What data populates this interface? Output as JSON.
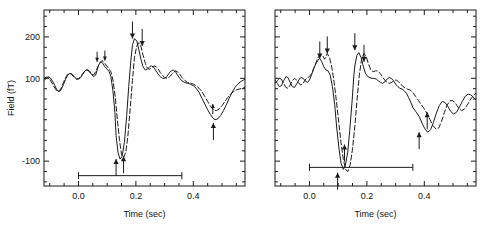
{
  "figure": {
    "type": "biomagnetic-field-waveform-figure",
    "panel_count": 2,
    "caption_partial": ""
  },
  "axes": {
    "xlabel": "Time (sec)",
    "ylabel": "Field (fT)",
    "xticks_labeled": [
      "0.0",
      "0.2",
      "0.4"
    ],
    "xtick_values": [
      0.0,
      0.2,
      0.4
    ],
    "yticks_labeled": [
      "200",
      "100",
      "-100"
    ],
    "ytick_values": [
      200,
      100,
      -100
    ],
    "xlim": [
      -0.12,
      0.58
    ],
    "ylim": [
      -160,
      265
    ],
    "grid": "off",
    "minor_ticks": "on"
  },
  "chart_data": {
    "type": "line",
    "title": "",
    "xlabel": "Time (sec)",
    "ylabel": "Field (fT)",
    "xlim": [
      -0.12,
      0.58
    ],
    "ylim": [
      -160,
      265
    ],
    "grid": false,
    "legend": "none",
    "panels": [
      {
        "name": "left-panel",
        "id": "panel-a",
        "y_axis_labeled": true,
        "stimulus_bar": {
          "start": 0.0,
          "end": 0.36,
          "y_value": -135
        },
        "annotations": [
          {
            "marker": "down-arrow",
            "x": 0.065,
            "y": 140,
            "size": "small"
          },
          {
            "marker": "down-arrow",
            "x": 0.092,
            "y": 143,
            "size": "small"
          },
          {
            "marker": "down-arrow",
            "x": 0.188,
            "y": 196,
            "size": "large"
          },
          {
            "marker": "down-arrow",
            "x": 0.222,
            "y": 178,
            "size": "large"
          },
          {
            "marker": "up-arrow",
            "x": 0.131,
            "y": -95,
            "size": "large"
          },
          {
            "marker": "up-arrow",
            "x": 0.157,
            "y": -88,
            "size": "large"
          },
          {
            "marker": "up-arrow",
            "x": 0.468,
            "y": 38,
            "size": "small"
          },
          {
            "marker": "up-arrow",
            "x": 0.47,
            "y": -8,
            "size": "large"
          }
        ],
        "series": [
          {
            "name": "trace-solid",
            "style": "solid",
            "x": [
              -0.12,
              -0.112,
              -0.105,
              -0.098,
              -0.09,
              -0.082,
              -0.075,
              -0.067,
              -0.06,
              -0.052,
              -0.045,
              -0.037,
              -0.03,
              -0.022,
              -0.015,
              -0.007,
              0.0,
              0.008,
              0.015,
              0.023,
              0.03,
              0.038,
              0.045,
              0.053,
              0.06,
              0.065,
              0.07,
              0.078,
              0.085,
              0.092,
              0.1,
              0.107,
              0.113,
              0.12,
              0.127,
              0.131,
              0.138,
              0.145,
              0.152,
              0.16,
              0.168,
              0.175,
              0.182,
              0.188,
              0.195,
              0.203,
              0.21,
              0.218,
              0.225,
              0.233,
              0.24,
              0.248,
              0.255,
              0.263,
              0.27,
              0.278,
              0.285,
              0.293,
              0.3,
              0.308,
              0.315,
              0.323,
              0.33,
              0.338,
              0.345,
              0.353,
              0.36,
              0.37,
              0.38,
              0.39,
              0.4,
              0.41,
              0.42,
              0.43,
              0.44,
              0.45,
              0.46,
              0.468,
              0.475,
              0.485,
              0.495,
              0.505,
              0.515,
              0.525,
              0.535,
              0.545,
              0.555,
              0.565,
              0.575,
              0.58
            ],
            "y": [
              95,
              100,
              104,
              101,
              93,
              82,
              72,
              68,
              73,
              85,
              98,
              108,
              112,
              110,
              104,
              99,
              98,
              102,
              110,
              118,
              121,
              118,
              110,
              104,
              108,
              120,
              132,
              140,
              136,
              128,
              122,
              116,
              104,
              70,
              18,
              -38,
              -80,
              -95,
              -88,
              -55,
              10,
              80,
              140,
              180,
              196,
              190,
              170,
              145,
              128,
              120,
              122,
              128,
              130,
              126,
              118,
              110,
              104,
              100,
              100,
              104,
              112,
              118,
              120,
              116,
              108,
              100,
              94,
              90,
              88,
              86,
              82,
              76,
              66,
              52,
              38,
              24,
              12,
              4,
              0,
              2,
              10,
              22,
              36,
              52,
              66,
              78,
              86,
              92,
              96,
              98,
              98
            ]
          },
          {
            "name": "trace-dashed",
            "style": "dashed",
            "x": [
              -0.12,
              -0.112,
              -0.105,
              -0.098,
              -0.09,
              -0.082,
              -0.075,
              -0.067,
              -0.06,
              -0.052,
              -0.045,
              -0.037,
              -0.03,
              -0.022,
              -0.015,
              -0.007,
              0.0,
              0.008,
              0.015,
              0.023,
              0.03,
              0.038,
              0.045,
              0.053,
              0.06,
              0.068,
              0.075,
              0.082,
              0.09,
              0.098,
              0.105,
              0.113,
              0.12,
              0.128,
              0.135,
              0.143,
              0.15,
              0.157,
              0.165,
              0.172,
              0.18,
              0.188,
              0.195,
              0.203,
              0.21,
              0.218,
              0.225,
              0.233,
              0.24,
              0.248,
              0.255,
              0.263,
              0.27,
              0.278,
              0.285,
              0.293,
              0.3,
              0.308,
              0.315,
              0.323,
              0.33,
              0.338,
              0.345,
              0.353,
              0.36,
              0.37,
              0.38,
              0.39,
              0.4,
              0.41,
              0.42,
              0.43,
              0.44,
              0.45,
              0.46,
              0.47,
              0.48,
              0.49,
              0.5,
              0.51,
              0.52,
              0.53,
              0.54,
              0.55,
              0.56,
              0.57,
              0.58
            ],
            "y": [
              100,
              103,
              102,
              96,
              86,
              76,
              69,
              69,
              77,
              90,
              102,
              110,
              112,
              108,
              102,
              98,
              99,
              104,
              112,
              118,
              120,
              116,
              110,
              108,
              116,
              128,
              138,
              143,
              138,
              130,
              124,
              116,
              96,
              56,
              4,
              -50,
              -84,
              -92,
              -78,
              -40,
              26,
              95,
              150,
              178,
              186,
              176,
              156,
              136,
              124,
              122,
              126,
              130,
              128,
              122,
              114,
              107,
              102,
              100,
              102,
              108,
              114,
              118,
              116,
              110,
              102,
              95,
              90,
              88,
              86,
              82,
              76,
              68,
              56,
              44,
              32,
              24,
              22,
              26,
              34,
              44,
              54,
              62,
              68,
              72,
              74,
              76,
              78,
              80,
              82
            ]
          }
        ]
      },
      {
        "name": "right-panel",
        "id": "panel-b",
        "y_axis_labeled": false,
        "stimulus_bar": {
          "start": 0.0,
          "end": 0.36,
          "y_value": -115
        },
        "annotations": [
          {
            "marker": "down-arrow",
            "x": 0.036,
            "y": 148,
            "size": "large"
          },
          {
            "marker": "down-arrow",
            "x": 0.062,
            "y": 160,
            "size": "large"
          },
          {
            "marker": "down-arrow",
            "x": 0.158,
            "y": 168,
            "size": "large"
          },
          {
            "marker": "down-arrow",
            "x": 0.19,
            "y": 140,
            "size": "large"
          },
          {
            "marker": "up-arrow",
            "x": 0.122,
            "y": -60,
            "size": "large"
          },
          {
            "marker": "up-arrow",
            "x": 0.098,
            "y": -128,
            "size": "large"
          },
          {
            "marker": "up-arrow",
            "x": 0.41,
            "y": 18,
            "size": "large"
          },
          {
            "marker": "up-arrow",
            "x": 0.382,
            "y": -30,
            "size": "large"
          }
        ],
        "series": [
          {
            "name": "trace-solid",
            "style": "solid",
            "x": [
              -0.12,
              -0.112,
              -0.105,
              -0.098,
              -0.09,
              -0.082,
              -0.075,
              -0.067,
              -0.06,
              -0.052,
              -0.045,
              -0.037,
              -0.03,
              -0.022,
              -0.015,
              -0.007,
              0.0,
              0.008,
              0.015,
              0.023,
              0.03,
              0.036,
              0.043,
              0.05,
              0.058,
              0.065,
              0.072,
              0.08,
              0.088,
              0.095,
              0.103,
              0.11,
              0.118,
              0.125,
              0.133,
              0.14,
              0.148,
              0.155,
              0.158,
              0.165,
              0.172,
              0.18,
              0.188,
              0.195,
              0.203,
              0.21,
              0.218,
              0.225,
              0.233,
              0.24,
              0.248,
              0.255,
              0.263,
              0.27,
              0.278,
              0.285,
              0.293,
              0.3,
              0.308,
              0.315,
              0.323,
              0.33,
              0.338,
              0.345,
              0.353,
              0.36,
              0.37,
              0.382,
              0.392,
              0.402,
              0.412,
              0.422,
              0.432,
              0.442,
              0.452,
              0.462,
              0.472,
              0.482,
              0.492,
              0.502,
              0.512,
              0.522,
              0.532,
              0.542,
              0.552,
              0.562,
              0.572,
              0.58
            ],
            "y": [
              96,
              88,
              80,
              82,
              94,
              104,
              102,
              90,
              80,
              78,
              86,
              96,
              102,
              100,
              94,
              90,
              96,
              110,
              124,
              136,
              144,
              148,
              140,
              128,
              120,
              118,
              108,
              80,
              36,
              -20,
              -70,
              -105,
              -120,
              -110,
              -80,
              -28,
              40,
              110,
              130,
              155,
              162,
              150,
              128,
              112,
              104,
              102,
              100,
              100,
              98,
              94,
              90,
              88,
              92,
              98,
              102,
              100,
              94,
              86,
              80,
              76,
              74,
              70,
              64,
              54,
              42,
              30,
              20,
              8,
              -8,
              -22,
              -30,
              -24,
              -6,
              16,
              34,
              44,
              42,
              32,
              20,
              14,
              18,
              30,
              44,
              56,
              62,
              60,
              54,
              48,
              44
            ]
          },
          {
            "name": "trace-dashed",
            "style": "dashed",
            "x": [
              -0.12,
              -0.112,
              -0.105,
              -0.098,
              -0.09,
              -0.082,
              -0.075,
              -0.067,
              -0.06,
              -0.052,
              -0.045,
              -0.037,
              -0.03,
              -0.022,
              -0.015,
              -0.007,
              0.0,
              0.008,
              0.015,
              0.023,
              0.03,
              0.038,
              0.045,
              0.053,
              0.062,
              0.07,
              0.078,
              0.086,
              0.094,
              0.102,
              0.11,
              0.118,
              0.126,
              0.134,
              0.142,
              0.15,
              0.158,
              0.166,
              0.174,
              0.182,
              0.19,
              0.198,
              0.206,
              0.214,
              0.222,
              0.23,
              0.238,
              0.246,
              0.254,
              0.262,
              0.27,
              0.278,
              0.286,
              0.294,
              0.302,
              0.31,
              0.318,
              0.326,
              0.334,
              0.342,
              0.35,
              0.36,
              0.37,
              0.38,
              0.39,
              0.4,
              0.41,
              0.42,
              0.43,
              0.44,
              0.45,
              0.46,
              0.47,
              0.48,
              0.49,
              0.5,
              0.51,
              0.52,
              0.53,
              0.54,
              0.55,
              0.56,
              0.57,
              0.58
            ],
            "y": [
              88,
              94,
              100,
              98,
              88,
              78,
              76,
              84,
              94,
              100,
              96,
              88,
              84,
              88,
              96,
              102,
              104,
              112,
              124,
              138,
              150,
              158,
              156,
              146,
              160,
              150,
              126,
              90,
              44,
              -6,
              -56,
              -96,
              -120,
              -125,
              -108,
              -70,
              -16,
              50,
              110,
              148,
              160,
              152,
              134,
              120,
              116,
              118,
              118,
              112,
              104,
              96,
              90,
              88,
              90,
              94,
              96,
              92,
              86,
              80,
              76,
              74,
              72,
              66,
              56,
              46,
              36,
              26,
              14,
              0,
              -14,
              -22,
              -20,
              -4,
              18,
              36,
              46,
              46,
              38,
              28,
              22,
              26,
              36,
              48,
              58,
              64
            ]
          }
        ]
      }
    ]
  }
}
